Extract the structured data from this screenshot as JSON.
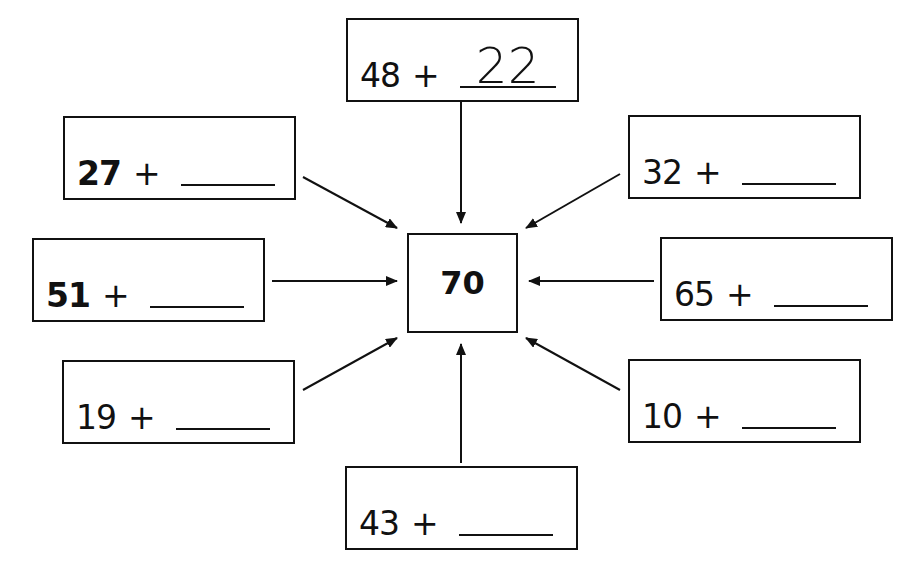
{
  "worksheet": {
    "target": "70",
    "boxes": [
      {
        "id": "top",
        "addend": "48",
        "operator": "+",
        "answer": "22"
      },
      {
        "id": "upper-left",
        "addend": "27",
        "operator": "+",
        "answer": ""
      },
      {
        "id": "upper-right",
        "addend": "32",
        "operator": "+",
        "answer": ""
      },
      {
        "id": "left",
        "addend": "51",
        "operator": "+",
        "answer": ""
      },
      {
        "id": "right",
        "addend": "65",
        "operator": "+",
        "answer": ""
      },
      {
        "id": "lower-left",
        "addend": "19",
        "operator": "+",
        "answer": ""
      },
      {
        "id": "lower-right",
        "addend": "10",
        "operator": "+",
        "answer": ""
      },
      {
        "id": "bottom",
        "addend": "43",
        "operator": "+",
        "answer": ""
      }
    ]
  }
}
